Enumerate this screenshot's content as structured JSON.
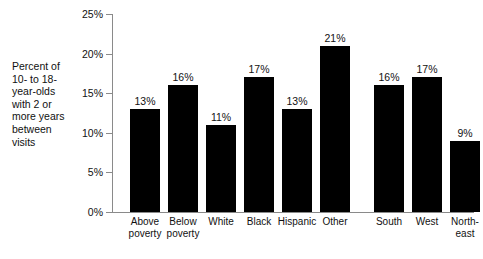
{
  "caption": "Percent of\n10- to 18-\nyear-olds\nwith 2 or\nmore years\nbetween\nvisits",
  "chart_data": {
    "type": "bar",
    "title": "",
    "subtitle": "",
    "xlabel": "",
    "ylabel": "Percent of 10- to 18-year-olds with 2 or more years between visits",
    "ylim": [
      0,
      25
    ],
    "yticks": [
      0,
      5,
      10,
      15,
      20,
      25
    ],
    "ytick_labels": [
      "0%",
      "5%",
      "10%",
      "15%",
      "20%",
      "25%"
    ],
    "ytick_suffix": "%",
    "grid": false,
    "legend": "none",
    "bar_color": "#000000",
    "axis_color": "#8a8a8a",
    "categories": [
      "Above\npoverty",
      "Below\npoverty",
      "White",
      "Black",
      "Hispanic",
      "Other",
      "South",
      "West",
      "North-\neast",
      "Midwest"
    ],
    "values": [
      13,
      16,
      11,
      17,
      13,
      21,
      16,
      17,
      9,
      11
    ],
    "value_labels": [
      "13%",
      "16%",
      "11%",
      "17%",
      "13%",
      "21%",
      "16%",
      "17%",
      "9%",
      "11%"
    ],
    "group_break_after_index": 5
  }
}
